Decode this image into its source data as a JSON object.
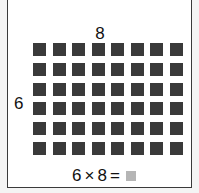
{
  "diagram": {
    "columns_label": "8",
    "rows_label": "6",
    "rows": 6,
    "columns": 8,
    "cell_color": "#3a3a3a",
    "equation": {
      "left": "6",
      "operator": "×",
      "right": "8",
      "equals": "=",
      "answer_placeholder_color": "#b5b5b5"
    }
  }
}
